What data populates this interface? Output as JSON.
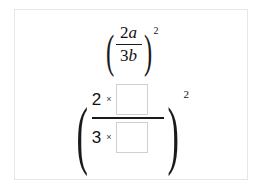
{
  "card": {
    "background_color": "#ffffff",
    "border_color": "#e6e6e6"
  },
  "given_expression": {
    "name": "given-expression",
    "open_paren": "(",
    "close_paren": ")",
    "numerator_coefficient": "2",
    "numerator_variable": "a",
    "denominator_coefficient": "3",
    "denominator_variable": "b",
    "exponent": "2",
    "plain_text": "(2a/3b)^2"
  },
  "answer_expression": {
    "name": "answer-expression",
    "open_paren": "(",
    "close_paren": ")",
    "numerator_coefficient": "2",
    "numerator_operator": "×",
    "denominator_coefficient": "3",
    "denominator_operator": "×",
    "exponent": "2",
    "plain_text": "(2 × [ ] / 3 × [ ])^2",
    "numerator_input": {
      "name": "numerator-answer-box",
      "value": "",
      "placeholder": ""
    },
    "denominator_input": {
      "name": "denominator-answer-box",
      "value": "",
      "placeholder": ""
    }
  },
  "colors": {
    "text": "#111111",
    "box_border": "#cfcfcf",
    "rule": "#1a1a1a"
  }
}
